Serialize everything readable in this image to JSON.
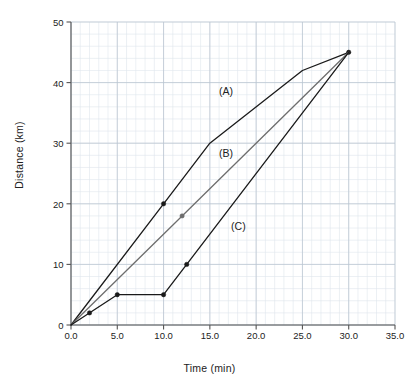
{
  "chart_data": {
    "type": "line",
    "title": "",
    "xlabel": "Time (min)",
    "ylabel": "Distance (km)",
    "xlim": [
      0,
      35
    ],
    "ylim": [
      0,
      50
    ],
    "xticks": [
      "0.0",
      "5.0",
      "10.0",
      "15.0",
      "20.0",
      "25.0",
      "30.0",
      "35.0"
    ],
    "xtick_values": [
      0,
      5,
      10,
      15,
      20,
      25,
      30,
      35
    ],
    "yticks": [
      "0",
      "10",
      "20",
      "30",
      "40",
      "50"
    ],
    "ytick_values": [
      0,
      10,
      20,
      30,
      40,
      50
    ],
    "xminor_step": 1,
    "yminor_step": 2,
    "grid": "major and minor graph-paper grid",
    "legend": "inline annotations (A), (B), (C)",
    "background": "#ffffff",
    "grid_major_color": "#b9c4d0",
    "grid_minor_color": "#dfe5ec",
    "axis_color": "#555555",
    "series": [
      {
        "name": "(A)",
        "color": "#1a1a1a",
        "label": "(A)",
        "label_x": 16.0,
        "label_y": 38.4,
        "points": [
          {
            "x": 0,
            "y": 0
          },
          {
            "x": 10,
            "y": 20
          },
          {
            "x": 15,
            "y": 30
          },
          {
            "x": 25,
            "y": 42
          },
          {
            "x": 30,
            "y": 45
          }
        ],
        "markers": [
          {
            "x": 10,
            "y": 20
          },
          {
            "x": 30,
            "y": 45
          }
        ]
      },
      {
        "name": "(B)",
        "color": "#6e6e6e",
        "label": "(B)",
        "label_x": 16.0,
        "label_y": 28.2,
        "points": [
          {
            "x": 0,
            "y": 0
          },
          {
            "x": 12,
            "y": 18
          },
          {
            "x": 30,
            "y": 45
          }
        ],
        "markers": [
          {
            "x": 12,
            "y": 18
          }
        ]
      },
      {
        "name": "(C)",
        "color": "#1a1a1a",
        "label": "(C)",
        "label_x": 17.3,
        "label_y": 16.1,
        "points": [
          {
            "x": 0,
            "y": 0
          },
          {
            "x": 5,
            "y": 5
          },
          {
            "x": 10,
            "y": 5
          },
          {
            "x": 12.5,
            "y": 10
          },
          {
            "x": 30,
            "y": 45
          }
        ],
        "markers": [
          {
            "x": 2,
            "y": 2
          },
          {
            "x": 5,
            "y": 5
          },
          {
            "x": 10,
            "y": 5
          },
          {
            "x": 12.5,
            "y": 10
          }
        ]
      }
    ]
  }
}
